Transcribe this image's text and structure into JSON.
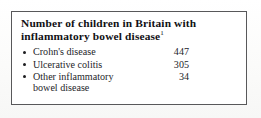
{
  "figure": {
    "title": "Number of children in Britain with inflammatory bowel disease",
    "title_superscript": "1",
    "border_color": "#58585a",
    "text_color": "#25252a",
    "background_color": "#ffffff",
    "rows": [
      {
        "bullet": "bullet-icon",
        "label": "Crohn's disease",
        "value": "447"
      },
      {
        "bullet": "bullet-icon",
        "label": "Ulcerative colitis",
        "value": "305"
      },
      {
        "bullet": "bullet-icon",
        "label": "Other inflammatory\nbowel disease",
        "value": "34"
      }
    ]
  },
  "chart_data": {
    "type": "table",
    "title": "Number of children in Britain with inflammatory bowel disease",
    "categories": [
      "Crohn's disease",
      "Ulcerative colitis",
      "Other inflammatory bowel disease"
    ],
    "values": [
      447,
      305,
      34
    ],
    "xlabel": "",
    "ylabel": "Number of children",
    "annotations": [
      "Superscript reference marker 1 follows the title"
    ]
  }
}
